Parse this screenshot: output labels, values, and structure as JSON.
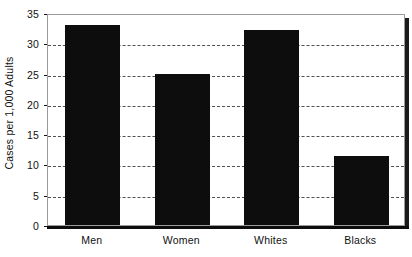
{
  "chart_data": {
    "type": "bar",
    "title": "",
    "subtitle": "",
    "xlabel": "",
    "ylabel": "Cases per 1,000 Adults",
    "categories": [
      "Men",
      "Women",
      "Whites",
      "Blacks"
    ],
    "values": [
      33,
      25,
      32.2,
      11.4
    ],
    "series": [
      {
        "name": "Cases per 1,000 Adults",
        "values": [
          33,
          25,
          32.2,
          11.4
        ]
      }
    ],
    "ylim": [
      0,
      35
    ],
    "ytick_labels": [
      "0",
      "5",
      "10",
      "15",
      "20",
      "25",
      "30",
      "35"
    ],
    "ytick_values": [
      0,
      5,
      10,
      15,
      20,
      25,
      30,
      35
    ],
    "grid": "horizontal-dashed",
    "legend": "none",
    "bar_color": "#0d0d0d",
    "gridline_color": "#333333",
    "frame_color": "#9a9a9a",
    "axis_color": "#0d0d0d",
    "background_color": "#ffffff",
    "text_color": "#111111"
  }
}
